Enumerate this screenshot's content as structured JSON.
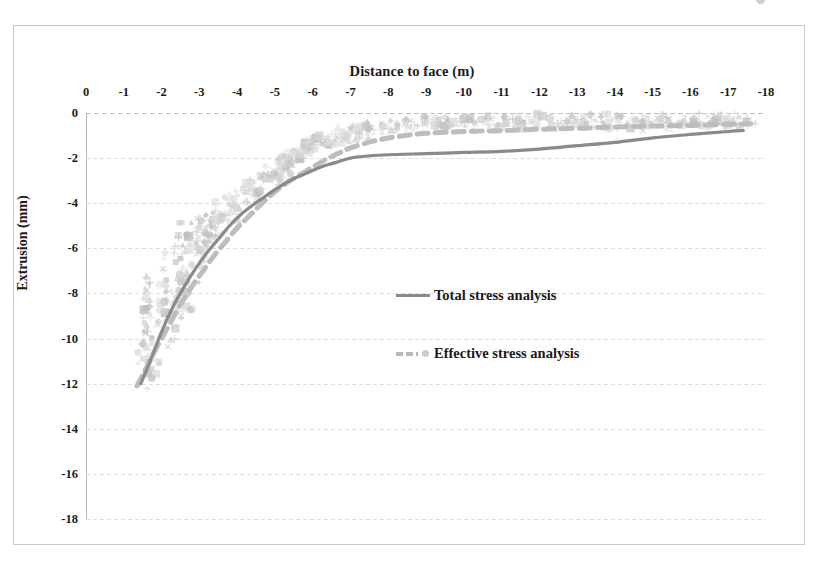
{
  "figure": {
    "background": "#ffffff",
    "border_color": "#c9c9c9"
  },
  "chart_data": {
    "type": "scatter",
    "title": "Distance to face (m)",
    "subtitle": "",
    "xlabel": "Distance to face (m)",
    "ylabel": "Extrusion (mm)",
    "xlim": [
      0,
      -18
    ],
    "ylim": [
      0,
      -18
    ],
    "x_ticks": [
      "0",
      "-1",
      "-2",
      "-3",
      "-4",
      "-5",
      "-6",
      "-7",
      "-8",
      "-9",
      "-10",
      "-11",
      "-12",
      "-13",
      "-14",
      "-15",
      "-16",
      "-17",
      "-18"
    ],
    "x_tick_values": [
      0,
      -1,
      -2,
      -3,
      -4,
      -5,
      -6,
      -7,
      -8,
      -9,
      -10,
      -11,
      -12,
      -13,
      -14,
      -15,
      -16,
      -17,
      -18
    ],
    "y_ticks": [
      "0",
      "-2",
      "-4",
      "-6",
      "-8",
      "-10",
      "-12",
      "-14",
      "-16",
      "-18"
    ],
    "y_tick_values": [
      0,
      -2,
      -4,
      -6,
      -8,
      -10,
      -12,
      -14,
      -16,
      -18
    ],
    "grid": "horizontal-only",
    "legend_position": "center",
    "colors": {
      "total_stress_line": "#8a8a8a",
      "effective_stress_line": "#bdbdbd",
      "scatter_marker": "#c8c8c8",
      "gridline": "#dedede",
      "axis": "#b5b5b5"
    },
    "series": [
      {
        "name": "Total stress analysis",
        "style": "solid-line",
        "color": "#8a8a8a",
        "x": [
          -1.45,
          -1.7,
          -2.0,
          -2.3,
          -2.6,
          -2.9,
          -3.2,
          -3.5,
          -3.8,
          -4.1,
          -4.4,
          -4.7,
          -5.0,
          -5.4,
          -5.8,
          -6.2,
          -6.6,
          -7.0,
          -7.5,
          -8.0,
          -9.0,
          -10.0,
          -11.0,
          -12.0,
          -13.0,
          -14.0,
          -15.0,
          -16.0,
          -17.0,
          -17.4
        ],
        "y": [
          -12.0,
          -11.0,
          -9.7,
          -8.6,
          -7.7,
          -6.9,
          -6.2,
          -5.6,
          -5.0,
          -4.5,
          -4.1,
          -3.75,
          -3.4,
          -3.0,
          -2.7,
          -2.4,
          -2.2,
          -2.0,
          -1.9,
          -1.85,
          -1.8,
          -1.75,
          -1.7,
          -1.6,
          -1.45,
          -1.3,
          -1.1,
          -0.95,
          -0.82,
          -0.78
        ]
      },
      {
        "name": "Effective stress analysis",
        "style": "dashed-line",
        "color": "#bdbdbd",
        "x": [
          -1.35,
          -1.6,
          -1.9,
          -2.2,
          -2.5,
          -2.8,
          -3.1,
          -3.4,
          -3.7,
          -4.0,
          -4.3,
          -4.6,
          -5.0,
          -5.4,
          -5.8,
          -6.2,
          -6.6,
          -7.0,
          -7.6,
          -8.2,
          -9.0,
          -10.0,
          -11.0,
          -12.0,
          -13.0,
          -14.0,
          -15.0,
          -16.0,
          -17.0,
          -17.6
        ],
        "y": [
          -12.1,
          -11.3,
          -10.3,
          -9.4,
          -8.5,
          -7.7,
          -7.0,
          -6.3,
          -5.7,
          -5.1,
          -4.6,
          -4.1,
          -3.5,
          -3.0,
          -2.6,
          -2.2,
          -1.85,
          -1.55,
          -1.25,
          -1.05,
          -0.9,
          -0.82,
          -0.78,
          -0.72,
          -0.68,
          -0.62,
          -0.58,
          -0.55,
          -0.5,
          -0.48
        ]
      }
    ],
    "scatter_points": {
      "name": "Measured extrusion readings",
      "description": "Dense cloud of faint grey markers (diamonds, squares, triangles, crosses, circles) scattered around both fitted curves",
      "x": [
        -1.5,
        -1.5,
        -1.5,
        -1.5,
        -1.55,
        -1.6,
        -1.6,
        -1.65,
        -1.7,
        -1.8,
        -1.85,
        -1.9,
        -1.95,
        -2.0,
        -2.05,
        -2.1,
        -2.2,
        -2.3,
        -2.35,
        -2.4,
        -2.45,
        -2.5,
        -2.5,
        -2.55,
        -2.6,
        -2.65,
        -2.7,
        -2.75,
        -2.8,
        -2.85,
        -2.9,
        -2.95,
        -3.0,
        -3.0,
        -3.05,
        -3.1,
        -3.15,
        -3.2,
        -3.25,
        -3.3,
        -3.35,
        -3.4,
        -3.45,
        -3.5,
        -3.55,
        -3.6,
        -3.7,
        -3.8,
        -3.9,
        -4.0,
        -4.1,
        -4.2,
        -4.3,
        -4.4,
        -4.5,
        -4.6,
        -4.7,
        -4.8,
        -4.9,
        -5.0,
        -5.05,
        -5.1,
        -5.2,
        -5.25,
        -5.3,
        -5.35,
        -5.4,
        -5.45,
        -5.5,
        -5.55,
        -5.6,
        -5.65,
        -5.7,
        -5.8,
        -5.9,
        -6.0,
        -6.1,
        -6.2,
        -6.3,
        -6.4,
        -6.5,
        -6.6,
        -6.7,
        -6.8,
        -6.9,
        -7.0,
        -7.1,
        -7.2,
        -7.3,
        -7.4,
        -7.5,
        -7.6,
        -7.8,
        -8.0,
        -8.2,
        -8.4,
        -8.6,
        -8.8,
        -9.0,
        -9.2,
        -9.4,
        -9.6,
        -9.8,
        -10.0,
        -10.2,
        -10.4,
        -10.6,
        -10.8,
        -11.0,
        -11.2,
        -11.4,
        -11.6,
        -11.8,
        -12.0,
        -12.2,
        -12.4,
        -12.6,
        -12.8,
        -13.0,
        -13.2,
        -13.4,
        -13.6,
        -13.8,
        -14.0,
        -14.2,
        -14.4,
        -14.6,
        -14.8,
        -15.0,
        -15.2,
        -15.4,
        -15.6,
        -15.8,
        -16.0,
        -16.2,
        -16.4,
        -16.6,
        -16.8,
        -17.0,
        -17.2,
        -17.4,
        -17.6,
        -17.8
      ],
      "y": [
        -12.0,
        -11.4,
        -10.8,
        -10.2,
        -9.6,
        -9.2,
        -8.6,
        -8.0,
        -7.4,
        -11.2,
        -10.4,
        -9.7,
        -9.0,
        -8.4,
        -7.8,
        -7.2,
        -6.7,
        -9.8,
        -9.0,
        -8.3,
        -7.6,
        -7.0,
        -6.4,
        -5.9,
        -5.4,
        -8.2,
        -7.6,
        -7.0,
        -6.5,
        -6.0,
        -5.5,
        -5.1,
        -7.0,
        -6.4,
        -5.9,
        -5.5,
        -5.1,
        -4.7,
        -6.2,
        -5.7,
        -5.3,
        -4.9,
        -4.5,
        -4.2,
        -5.2,
        -4.8,
        -4.4,
        -4.0,
        -3.7,
        -4.3,
        -4.0,
        -3.7,
        -3.4,
        -3.2,
        -3.6,
        -3.3,
        -3.0,
        -2.8,
        -2.6,
        -3.0,
        -2.8,
        -2.6,
        -2.4,
        -2.2,
        -2.5,
        -2.3,
        -2.1,
        -1.9,
        -2.2,
        -2.0,
        -1.8,
        -1.6,
        -1.7,
        -1.5,
        -1.4,
        -1.6,
        -1.4,
        -1.3,
        -1.2,
        -1.3,
        -1.1,
        -1.0,
        -1.1,
        -0.9,
        -0.8,
        -1.0,
        -0.8,
        -0.7,
        -0.9,
        -0.7,
        -0.6,
        -0.8,
        -0.6,
        -0.7,
        -0.5,
        -0.6,
        -0.5,
        -0.6,
        -0.4,
        -0.5,
        -0.4,
        -0.5,
        -0.4,
        -0.5,
        -0.4,
        -0.5,
        -0.3,
        -0.4,
        -0.5,
        -0.3,
        -0.4,
        -0.5,
        -0.3,
        -0.4,
        -0.3,
        -0.4,
        -0.5,
        -0.3,
        -0.4,
        -0.3,
        -0.4,
        -0.5,
        -0.3,
        -0.4,
        -0.3,
        -0.4,
        -0.5,
        -0.3,
        -0.4,
        -0.3,
        -0.4,
        -0.5,
        -0.3,
        -0.4,
        -0.3,
        -0.4,
        -0.5,
        -0.3,
        -0.4,
        -0.3,
        -0.4,
        -0.3
      ]
    }
  },
  "legend": {
    "items": [
      {
        "label": "Total stress analysis",
        "style": "solid"
      },
      {
        "label": "Effective stress analysis",
        "style": "dashed-with-marker"
      }
    ]
  }
}
